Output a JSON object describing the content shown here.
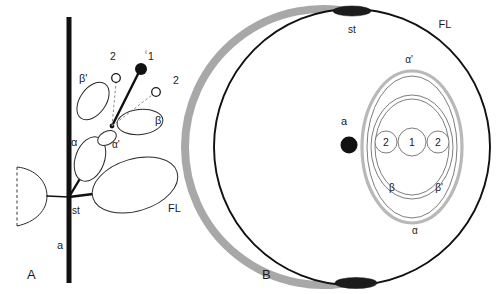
{
  "figure": {
    "type": "diagram",
    "panels": [
      {
        "id": "A",
        "label": "A",
        "view": "lateral-schematic",
        "labels": [
          {
            "name": "axis",
            "text": "a",
            "x": 57,
            "y": 249
          },
          {
            "name": "stem-node",
            "text": "st",
            "x": 72,
            "y": 214
          },
          {
            "name": "floral-leaf",
            "text": "FL",
            "x": 168,
            "y": 212
          },
          {
            "name": "alpha",
            "text": "α",
            "x": 71,
            "y": 146
          },
          {
            "name": "alpha-prime",
            "text": "α'",
            "x": 112,
            "y": 148
          },
          {
            "name": "beta",
            "text": "β",
            "x": 155,
            "y": 124
          },
          {
            "name": "beta-prime",
            "text": "β'",
            "x": 79,
            "y": 82
          },
          {
            "name": "order-two-left",
            "text": "2",
            "x": 110,
            "y": 60
          },
          {
            "name": "order-one",
            "text": "1",
            "x": 148,
            "y": 60
          },
          {
            "name": "order-two-right",
            "text": "2",
            "x": 173,
            "y": 84
          }
        ]
      },
      {
        "id": "B",
        "label": "B",
        "view": "transverse-floral-diagram",
        "labels": [
          {
            "name": "axis",
            "text": "a",
            "x": 348,
            "y": 125
          },
          {
            "name": "stem-node",
            "text": "st",
            "x": 343,
            "y": 30
          },
          {
            "name": "floral-leaf",
            "text": "FL",
            "x": 442,
            "y": 27
          },
          {
            "name": "alpha-prime",
            "text": "α'",
            "x": 404,
            "y": 60
          },
          {
            "name": "alpha",
            "text": "α",
            "x": 414,
            "y": 231
          },
          {
            "name": "beta",
            "text": "β",
            "x": 392,
            "y": 188
          },
          {
            "name": "beta-prime",
            "text": "β'",
            "x": 436,
            "y": 188
          },
          {
            "name": "flower-two-left",
            "text": "2",
            "x": 386,
            "y": 146
          },
          {
            "name": "flower-one",
            "text": "1",
            "x": 412,
            "y": 146
          },
          {
            "name": "flower-two-right",
            "text": "2",
            "x": 438,
            "y": 146
          }
        ]
      }
    ],
    "colors": {
      "ink": "#111111",
      "grey_band": "#a8a8a8",
      "grey_ellipse": "#b8b8b8",
      "thin_outline": "#6e6e6e",
      "background": "#ffffff"
    }
  }
}
